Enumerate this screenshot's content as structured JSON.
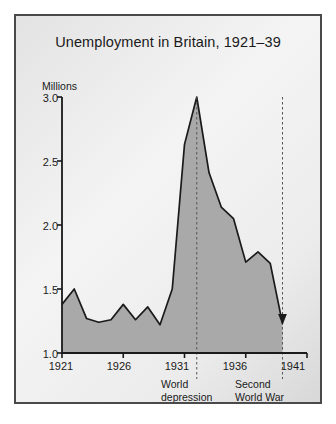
{
  "figure": {
    "title": "Unemployment in Britain, 1921–39",
    "y_unit_label": "Millions",
    "frame_color": "#4a4a4a",
    "area_fill_color": "#a9a9a9",
    "line_color": "#1a1a1a"
  },
  "axes": {
    "y_ticks": [
      "1.0",
      "1.5",
      "2.0",
      "2.5",
      "3.0"
    ],
    "x_ticks": [
      "1921",
      "1926",
      "1931",
      "1936",
      "1941"
    ]
  },
  "annotations": [
    {
      "name": "world-depression",
      "line1": "World",
      "line2": "depression",
      "year": 1932
    },
    {
      "name": "second-world-war",
      "line1": "Second",
      "line2": "World War",
      "year": 1939
    }
  ],
  "chart_data": {
    "type": "area",
    "title": "Unemployment in Britain, 1921–39",
    "xlabel": "",
    "ylabel": "Millions",
    "xlim": [
      1921,
      1941
    ],
    "ylim": [
      1.0,
      3.0
    ],
    "grid": false,
    "legend": null,
    "x": [
      1921,
      1922,
      1923,
      1924,
      1925,
      1926,
      1927,
      1928,
      1929,
      1930,
      1931,
      1932,
      1933,
      1934,
      1935,
      1936,
      1937,
      1938,
      1939
    ],
    "values": [
      1.38,
      1.5,
      1.27,
      1.24,
      1.26,
      1.38,
      1.26,
      1.36,
      1.22,
      1.5,
      2.63,
      3.0,
      2.41,
      2.14,
      2.05,
      1.71,
      1.79,
      1.7,
      1.23
    ],
    "series": [
      {
        "name": "Unemployment (millions)",
        "values": [
          1.38,
          1.5,
          1.27,
          1.24,
          1.26,
          1.38,
          1.26,
          1.36,
          1.22,
          1.5,
          2.63,
          3.0,
          2.41,
          2.14,
          2.05,
          1.71,
          1.79,
          1.7,
          1.23
        ]
      }
    ],
    "markers": [
      {
        "type": "dashed-vline",
        "year": 1932,
        "label": "World depression"
      },
      {
        "type": "dashed-vline",
        "year": 1939,
        "label": "Second World War"
      },
      {
        "type": "arrow-down",
        "year": 1939,
        "value": 1.23
      }
    ]
  }
}
